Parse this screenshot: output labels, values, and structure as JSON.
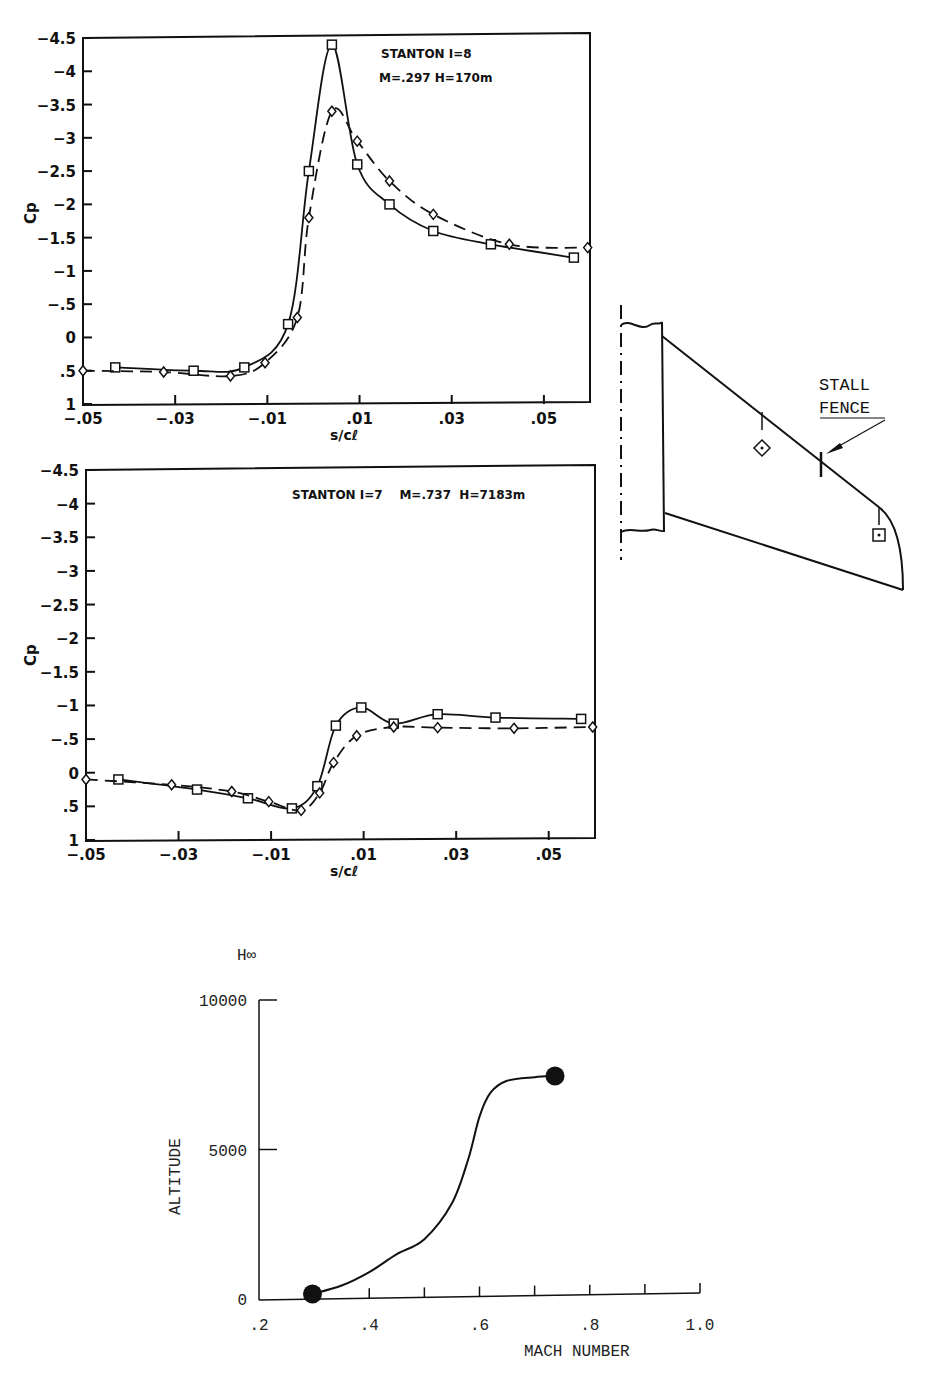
{
  "chart_data": [
    {
      "type": "line",
      "title": "STANTON I=8",
      "subtitle": "M=.297 H=170m",
      "xlabel": "s/cℓ",
      "ylabel": "Cp",
      "xlim": [
        -0.05,
        0.06
      ],
      "ylim": [
        1,
        -4.5
      ],
      "y_inverted": true,
      "x_ticks": [
        "-.05",
        "-.03",
        "-.01",
        ".01",
        ".03",
        ".05"
      ],
      "y_ticks": [
        "-4.5",
        "-4",
        "-3.5",
        "-3",
        "-2.5",
        "-2",
        "-1.5",
        "-1",
        "-.5",
        "0",
        ".5",
        "1"
      ],
      "grid": false,
      "series": [
        {
          "name": "square (solid line)",
          "marker": "square",
          "line": "solid",
          "x": [
            -0.043,
            -0.026,
            -0.015,
            -0.0055,
            -0.001,
            0.004,
            0.0095,
            0.0165,
            0.026,
            0.0385,
            0.0565
          ],
          "y": [
            0.45,
            0.5,
            0.45,
            -0.2,
            -2.5,
            -4.4,
            -2.6,
            -2.0,
            -1.6,
            -1.4,
            -1.2
          ]
        },
        {
          "name": "diamond (dashed line)",
          "marker": "diamond",
          "line": "dashed",
          "x": [
            -0.05,
            -0.0325,
            -0.018,
            -0.0105,
            -0.0035,
            -0.001,
            0.004,
            0.0095,
            0.0165,
            0.026,
            0.0425,
            0.0595
          ],
          "y": [
            0.5,
            0.52,
            0.58,
            0.38,
            -0.3,
            -1.8,
            -3.4,
            -2.95,
            -2.35,
            -1.85,
            -1.4,
            -1.35
          ]
        }
      ]
    },
    {
      "type": "line",
      "title": "STANTON I=7",
      "subtitle": "M=.737 H=7183m",
      "xlabel": "s/cℓ",
      "ylabel": "Cp",
      "xlim": [
        -0.05,
        0.06
      ],
      "ylim": [
        1,
        -4.5
      ],
      "y_inverted": true,
      "x_ticks": [
        "-.05",
        "-.03",
        "-.01",
        ".01",
        ".03",
        ".05"
      ],
      "y_ticks": [
        "-4.5",
        "-4",
        "-3.5",
        "-3",
        "-2.5",
        "-2",
        "-1.5",
        "-1",
        "-.5",
        "0",
        ".5",
        "1"
      ],
      "grid": false,
      "series": [
        {
          "name": "square (solid line)",
          "marker": "square",
          "line": "solid",
          "x": [
            -0.043,
            -0.026,
            -0.015,
            -0.0055,
            0.0,
            0.004,
            0.0095,
            0.0165,
            0.026,
            0.0385,
            0.057
          ],
          "y": [
            0.1,
            0.25,
            0.38,
            0.53,
            0.2,
            -0.7,
            -0.97,
            -0.73,
            -0.87,
            -0.82,
            -0.8
          ]
        },
        {
          "name": "diamond (dashed line)",
          "marker": "diamond",
          "line": "dashed",
          "x": [
            -0.05,
            -0.0315,
            -0.0185,
            -0.0105,
            -0.0035,
            0.0005,
            0.0035,
            0.0085,
            0.0165,
            0.026,
            0.0425,
            0.0595
          ],
          "y": [
            0.1,
            0.18,
            0.28,
            0.43,
            0.56,
            0.3,
            -0.15,
            -0.55,
            -0.68,
            -0.67,
            -0.66,
            -0.68
          ]
        }
      ]
    },
    {
      "type": "line",
      "title": "",
      "xlabel": "MACH NUMBER",
      "ylabel": "ALTITUDE",
      "y_unit_label": "H∞",
      "xlim": [
        0.2,
        1.0
      ],
      "ylim": [
        0,
        10000
      ],
      "x_ticks": [
        ".2",
        ".4",
        ".6",
        ".8",
        "1.0"
      ],
      "y_ticks": [
        "0",
        "5000",
        "10000"
      ],
      "grid": false,
      "series": [
        {
          "name": "flight path",
          "x": [
            0.297,
            0.35,
            0.4,
            0.45,
            0.5,
            0.55,
            0.58,
            0.6,
            0.62,
            0.65,
            0.7,
            0.737
          ],
          "y": [
            170,
            450,
            900,
            1500,
            2000,
            3200,
            4700,
            6100,
            6900,
            7300,
            7420,
            7460
          ],
          "endpoints": [
            {
              "x": 0.297,
              "y": 170
            },
            {
              "x": 0.737,
              "y": 7460
            }
          ]
        }
      ]
    }
  ],
  "plots": {
    "top": {
      "annotation_line1": "STANTON I=8",
      "annotation_line2": "M=.297  H=170m",
      "ylabel": "Cp",
      "xlabel": "s/cℓ"
    },
    "bottom": {
      "annotation": "STANTON I=7    M=.737  H=7183m",
      "ylabel": "Cp",
      "xlabel": "s/cℓ"
    },
    "altitude": {
      "ylabel": "ALTITUDE",
      "y_unit": "H∞",
      "xlabel": "MACH NUMBER"
    }
  },
  "wing_diagram": {
    "label_line1": "STALL",
    "label_line2": "FENCE",
    "markers": [
      "diamond-station",
      "square-station"
    ]
  }
}
